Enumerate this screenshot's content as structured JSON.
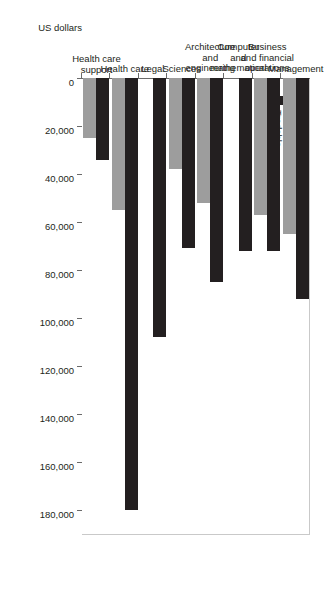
{
  "chart_data": {
    "type": "bar",
    "orientation": "horizontal",
    "title": "",
    "xlabel": "US dollars",
    "ylabel": "",
    "grid": false,
    "legend_position": "upper-left",
    "xlim": [
      0,
      190000
    ],
    "ticks": [
      0,
      20000,
      40000,
      60000,
      80000,
      100000,
      120000,
      140000,
      160000,
      180000
    ],
    "tick_labels": [
      "0",
      "20,000",
      "40,000",
      "60,000",
      "80,000",
      "100,000",
      "120,000",
      "140,000",
      "160,000",
      "180,000"
    ],
    "categories": [
      "Management",
      "Business\nand financial\noperations",
      "Computer\nand\nmathematical",
      "Architecture\nand\nengineering",
      "Sciences",
      "Legal",
      "Health care",
      "Health care\nsupport"
    ],
    "series": [
      {
        "name": "Nontradable",
        "color": "#9d9d9d",
        "values": [
          65000,
          57000,
          0,
          52000,
          38000,
          0,
          55000,
          25000
        ]
      },
      {
        "name": "Tradable",
        "color": "#231f20",
        "values": [
          92000,
          72000,
          72000,
          85000,
          71000,
          108000,
          180000,
          34000
        ]
      }
    ]
  },
  "axis": {
    "value_axis_title": "US dollars"
  },
  "legend": {
    "items": [
      {
        "label": "Nontradable",
        "color": "#9d9d9d"
      },
      {
        "label": "Tradable",
        "color": "#231f20"
      }
    ]
  }
}
